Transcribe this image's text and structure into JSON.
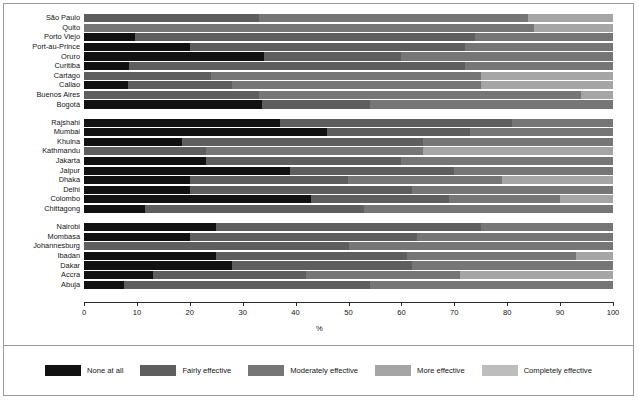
{
  "chart_data": {
    "type": "bar",
    "orientation": "horizontal",
    "stacked": true,
    "title": "",
    "xlabel": "%",
    "ylabel": "",
    "xlim": [
      0,
      100
    ],
    "xticks": [
      0,
      10,
      20,
      30,
      40,
      50,
      60,
      70,
      80,
      90,
      100
    ],
    "grid": false,
    "legend_position": "bottom",
    "series": [
      {
        "name": "None at all",
        "color": "#111111"
      },
      {
        "name": "Fairly effective",
        "color": "#5e5e5e"
      },
      {
        "name": "Moderately effective",
        "color": "#767676"
      },
      {
        "name": "More effective",
        "color": "#a5a5a5"
      },
      {
        "name": "Completely effective",
        "color": "#bdbdbd"
      }
    ],
    "groups": [
      {
        "name": "group-1",
        "categories": [
          "São Paulo",
          "Quito",
          "Porto Viejo",
          "Port-au-Prince",
          "Oruro",
          "Curitiba",
          "Cartago",
          "Callao",
          "Buenos Aires",
          "Bogotá"
        ],
        "values": [
          [
            0,
            33,
            51,
            16,
            0
          ],
          [
            0,
            0,
            85,
            15,
            0
          ],
          [
            9.6,
            64.4,
            26,
            0,
            0
          ],
          [
            20,
            52,
            28,
            0,
            0
          ],
          [
            34,
            26,
            40,
            0,
            0
          ],
          [
            8.5,
            63.5,
            28,
            0,
            0
          ],
          [
            0,
            24,
            51,
            25,
            0
          ],
          [
            8.3,
            19.7,
            47,
            25,
            0
          ],
          [
            0,
            33,
            61,
            6,
            0
          ],
          [
            33.6,
            20.4,
            46,
            0,
            0
          ]
        ]
      },
      {
        "name": "group-2",
        "categories": [
          "Rajshahi",
          "Mumbai",
          "Khulna",
          "Kathmandu",
          "Jakarta",
          "Jaipur",
          "Dhaka",
          "Delhi",
          "Colombo",
          "Chittagong"
        ],
        "values": [
          [
            37,
            44,
            19,
            0,
            0
          ],
          [
            46,
            27,
            27,
            0,
            0
          ],
          [
            18.5,
            45.5,
            36,
            0,
            0
          ],
          [
            0,
            23,
            41,
            36,
            0
          ],
          [
            23,
            37,
            40,
            0,
            0
          ],
          [
            39,
            31,
            30,
            0,
            0
          ],
          [
            20,
            30,
            29,
            21,
            0
          ],
          [
            20,
            42,
            38,
            0,
            0
          ],
          [
            43,
            26,
            21,
            10,
            0
          ],
          [
            11.5,
            41.5,
            47,
            0,
            0
          ]
        ]
      },
      {
        "name": "group-3",
        "categories": [
          "Nairobi",
          "Mombasa",
          "Johannesburg",
          "Ibadan",
          "Dakar",
          "Accra",
          "Abuja"
        ],
        "values": [
          [
            25,
            50,
            25,
            0,
            0
          ],
          [
            20,
            43,
            37,
            0,
            0
          ],
          [
            0,
            50,
            50,
            0,
            0
          ],
          [
            25,
            36,
            32,
            7,
            0
          ],
          [
            28,
            34,
            38,
            0,
            0
          ],
          [
            13,
            29,
            29,
            29,
            0
          ],
          [
            7.5,
            46.5,
            46,
            0,
            0
          ]
        ]
      }
    ]
  },
  "axis": {
    "x_title": "%",
    "tick_labels": [
      "0",
      "10",
      "20",
      "30",
      "40",
      "50",
      "60",
      "70",
      "80",
      "90",
      "100"
    ]
  },
  "legend": {
    "items": [
      {
        "label": "None at all",
        "color": "#111111"
      },
      {
        "label": "Fairly effective",
        "color": "#5e5e5e"
      },
      {
        "label": "Moderately effective",
        "color": "#767676"
      },
      {
        "label": "More effective",
        "color": "#a5a5a5"
      },
      {
        "label": "Completely effective",
        "color": "#bdbdbd"
      }
    ]
  }
}
